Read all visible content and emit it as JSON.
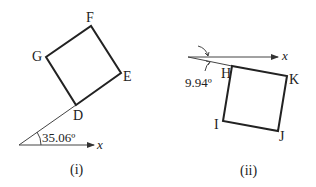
{
  "figures": [
    {
      "caption": "(i)",
      "axis_label": "x",
      "angle_label": "35.06º",
      "vertices": {
        "D": "D",
        "E": "E",
        "F": "F",
        "G": "G"
      }
    },
    {
      "caption": "(ii)",
      "axis_label": "x",
      "angle_label": "9.94º",
      "vertices": {
        "H": "H",
        "I": "I",
        "J": "J",
        "K": "K"
      }
    }
  ],
  "colors": {
    "stroke": "#222222",
    "background": "#ffffff"
  }
}
